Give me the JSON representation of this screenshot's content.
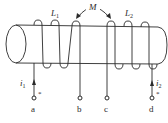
{
  "diagram": {
    "type": "coupled-inductors-on-core",
    "mutual_label": "M",
    "coils": [
      {
        "label": "L",
        "subscript": "1"
      },
      {
        "label": "L",
        "subscript": "2"
      }
    ],
    "currents": [
      {
        "label": "i",
        "subscript": "1",
        "terminal": "a"
      },
      {
        "label": "i",
        "subscript": "2",
        "terminal": "d"
      }
    ],
    "terminals": [
      {
        "label": "a",
        "dot_mark": "*"
      },
      {
        "label": "b",
        "dot_mark": ""
      },
      {
        "label": "c",
        "dot_mark": ""
      },
      {
        "label": "d",
        "dot_mark": "*"
      }
    ],
    "colors": {
      "line": "#2a2a2a",
      "background": "#ffffff"
    }
  }
}
